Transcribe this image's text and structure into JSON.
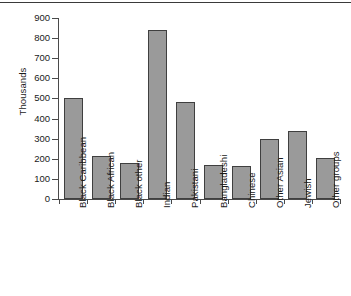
{
  "chart_data": {
    "type": "bar",
    "title": "",
    "xlabel": "",
    "ylabel": "Thousands",
    "ylim": [
      0,
      900
    ],
    "ytick_step": 100,
    "yticks": [
      0,
      100,
      200,
      300,
      400,
      500,
      600,
      700,
      800,
      900
    ],
    "grid": false,
    "legend": null,
    "legend_position": "none",
    "bar_fill_color": "#9a9a9a",
    "bar_edge_color": "#3f3f3f",
    "axis_color": "#4a4a4a",
    "text_color": "#1a1a1a",
    "xtick_label_rotation": -90,
    "categories": [
      "Black Caribbean",
      "Black African",
      "Black other",
      "Indian",
      "Pakistani",
      "Bangladeshi",
      "Chinese",
      "Other Asian",
      "Jewish",
      "Other groups"
    ],
    "values": [
      500,
      215,
      180,
      840,
      480,
      168,
      163,
      300,
      337,
      205
    ]
  }
}
